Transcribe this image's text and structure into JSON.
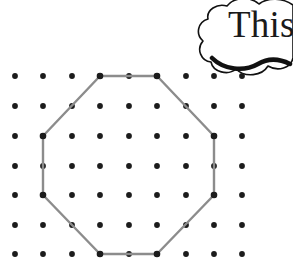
{
  "figure": {
    "background_color": "#ffffff"
  },
  "speech_bubble": {
    "name": "thought-bubble",
    "text": "This",
    "text_color": "#1a1a1a",
    "outline_color": "#111111",
    "clipped_at_right_edge": true,
    "text_x": 228,
    "text_y": 37,
    "font_size": 37
  },
  "grid": {
    "name": "dot-grid",
    "columns": 9,
    "rows": 7,
    "origin_x": 15,
    "origin_y": 76,
    "spacing_x": 28.4,
    "spacing_y": 29.7,
    "dot_radius": 2.9,
    "dot_color": "#1c1c1c",
    "column_x": [
      15,
      43,
      72,
      100,
      129,
      157,
      186,
      214,
      242
    ],
    "row_y": [
      76,
      106,
      136,
      166,
      195,
      225,
      254
    ]
  },
  "shape": {
    "name": "octagon",
    "type": "regular-octagon",
    "stroke_color": "#8c8c8c",
    "stroke_width": 2.4,
    "fill": "none",
    "vertex_count": 8,
    "vertices": [
      {
        "label": "top-left",
        "col": 3,
        "row": 0,
        "x": 100,
        "y": 76
      },
      {
        "label": "top-right",
        "col": 5,
        "row": 0,
        "x": 157,
        "y": 76
      },
      {
        "label": "right-top",
        "col": 7,
        "row": 2,
        "x": 214,
        "y": 136
      },
      {
        "label": "right-bottom",
        "col": 7,
        "row": 4,
        "x": 214,
        "y": 195
      },
      {
        "label": "bottom-right",
        "col": 5,
        "row": 6,
        "x": 157,
        "y": 254
      },
      {
        "label": "bottom-left",
        "col": 3,
        "row": 6,
        "x": 100,
        "y": 254
      },
      {
        "label": "left-bottom",
        "col": 1,
        "row": 4,
        "x": 43,
        "y": 195
      },
      {
        "label": "left-top",
        "col": 1,
        "row": 2,
        "x": 43,
        "y": 136
      }
    ],
    "polygon_points": "100,76 157,76 214,136 214,195 157,254 100,254 43,195 43,136"
  }
}
